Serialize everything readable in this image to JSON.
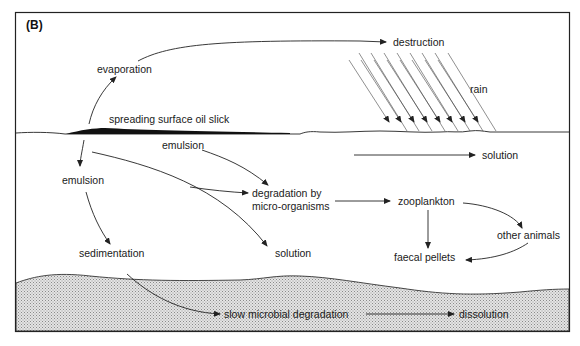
{
  "panel_label": "(B)",
  "labels": {
    "evaporation": "evaporation",
    "destruction": "destruction",
    "rain": "rain",
    "slick": "spreading surface oil slick",
    "emulsion_top": "emulsion",
    "emulsion_left": "emulsion",
    "solution_right": "solution",
    "degradation_line1": "degradation by",
    "degradation_line2": "micro-organisms",
    "zooplankton": "zooplankton",
    "other_animals": "other animals",
    "faecal_pellets": "faecal pellets",
    "sedimentation": "sedimentation",
    "solution_mid": "solution",
    "slow_degradation": "slow microbial degradation",
    "dissolution": "dissolution"
  },
  "colors": {
    "ink": "#1a1a1a",
    "sediment_fill": "#d6d6d6",
    "background": "#ffffff"
  }
}
